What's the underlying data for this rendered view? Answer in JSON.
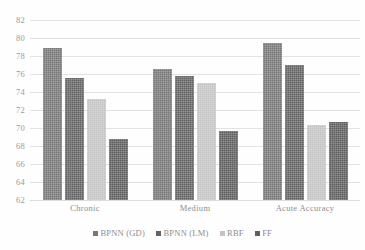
{
  "chart_data": {
    "type": "bar",
    "title": "",
    "subtitle": "",
    "xlabel": "",
    "ylabel": "",
    "ylim": [
      62,
      82
    ],
    "ytick_step": 2,
    "yticks": [
      82,
      80,
      78,
      76,
      74,
      72,
      70,
      68,
      66,
      64,
      62
    ],
    "grid": true,
    "grid_axis": "y",
    "legend_position": "bottom",
    "categories": [
      "Chronic",
      "Medium",
      "Acute Accuracy"
    ],
    "series": [
      {
        "name": "BPNN (GD)",
        "color": "#777777",
        "values": [
          78.9,
          76.6,
          79.5
        ]
      },
      {
        "name": "BPNN (LM)",
        "color": "#636363",
        "values": [
          75.6,
          75.8,
          77.0
        ]
      },
      {
        "name": "RBF",
        "color": "#c4c4c4",
        "values": [
          73.2,
          75.0,
          70.3
        ]
      },
      {
        "name": "FF",
        "color": "#5e5e5e",
        "values": [
          68.8,
          69.7,
          70.7
        ]
      }
    ]
  }
}
